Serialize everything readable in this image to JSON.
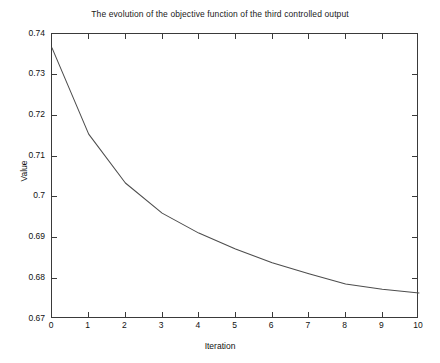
{
  "chart_data": {
    "type": "line",
    "title": "The evolution of the objective function of the third controlled output",
    "xlabel": "Iteration",
    "ylabel": "Value",
    "xlim": [
      0,
      10
    ],
    "ylim": [
      0.67,
      0.74
    ],
    "grid": false,
    "legend": null,
    "x_ticks": [
      "0",
      "1",
      "2",
      "3",
      "4",
      "5",
      "6",
      "7",
      "8",
      "9",
      "10"
    ],
    "y_ticks": [
      "0.67",
      "0.68",
      "0.69",
      "0.7",
      "0.71",
      "0.72",
      "0.73",
      "0.74"
    ],
    "x": [
      0,
      1,
      2,
      3,
      4,
      5,
      6,
      7,
      8,
      9,
      10
    ],
    "series": [
      {
        "name": "objective function",
        "color": "#4d4d4d",
        "values": [
          0.7366,
          0.7154,
          0.7034,
          0.696,
          0.6911,
          0.6872,
          0.6838,
          0.6811,
          0.6786,
          0.6773,
          0.6764
        ]
      }
    ]
  },
  "figure": {
    "title": "The evolution of the objective function of the third controlled output",
    "x_axis_title": "Iteration",
    "y_axis_title": "Value"
  }
}
